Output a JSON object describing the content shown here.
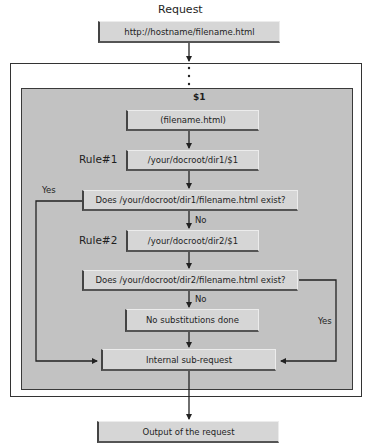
{
  "diagram": {
    "title": "Request",
    "input_url": "http://hostname/filename.html",
    "ellipsis": "⋮",
    "variable_label": "$1",
    "nodes": {
      "capture": "(filename.html)",
      "rule1_label": "Rule#1",
      "rule1_target": "/your/docroot/dir1/$1",
      "check1": "Does /your/docroot/dir1/filename.html exist?",
      "rule2_label": "Rule#2",
      "rule2_target": "/your/docroot/dir2/$1",
      "check2": "Does /your/docroot/dir2/filename.html exist?",
      "no_subs": "No substitutions done",
      "subrequest": "Internal sub-request",
      "output": "Output of the request"
    },
    "edge_labels": {
      "check1_yes": "Yes",
      "check1_no": "No",
      "check2_yes": "Yes",
      "check2_no": "No"
    },
    "colors": {
      "panel": "#c2c2c2",
      "box": "#d6d6d6",
      "line": "#222222"
    }
  }
}
